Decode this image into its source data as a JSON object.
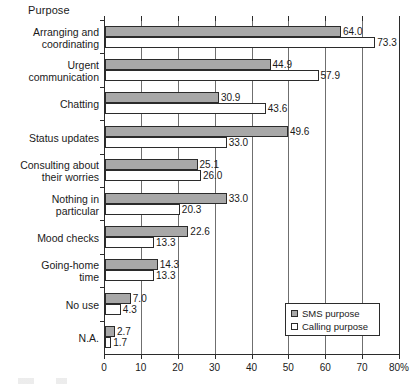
{
  "chart_data": {
    "type": "bar",
    "orientation": "horizontal",
    "title": "Purpose",
    "xlabel": "",
    "ylabel": "",
    "xlim": [
      0,
      80
    ],
    "xticks": [
      0,
      10,
      20,
      30,
      40,
      50,
      60,
      70,
      80
    ],
    "xtick_labels": [
      "0",
      "10",
      "20",
      "30",
      "40",
      "50",
      "60",
      "70",
      "80%"
    ],
    "grid": "vertical",
    "legend_position": "bottom-right",
    "categories": [
      "Arranging and coordinating",
      "Urgent communication",
      "Chatting",
      "Status updates",
      "Consulting about their worries",
      "Nothing in particular",
      "Mood checks",
      "Going-home time",
      "No use",
      "N.A."
    ],
    "category_lines": [
      [
        "Arranging and",
        "coordinating"
      ],
      [
        "Urgent",
        "communication"
      ],
      [
        "Chatting"
      ],
      [
        "Status updates"
      ],
      [
        "Consulting about",
        "their worries"
      ],
      [
        "Nothing in",
        "particular"
      ],
      [
        "Mood checks"
      ],
      [
        "Going-home",
        "time"
      ],
      [
        "No use"
      ],
      [
        "N.A."
      ]
    ],
    "series": [
      {
        "name": "SMS purpose",
        "color": "#a8a8a8",
        "values": [
          64.0,
          44.9,
          30.9,
          49.6,
          25.1,
          33.0,
          22.6,
          14.3,
          7.0,
          2.7
        ],
        "value_labels": [
          "64.0",
          "44.9",
          "30.9",
          "49.6",
          "25.1",
          "33.0",
          "22.6",
          "14.3",
          "7.0",
          "2.7"
        ]
      },
      {
        "name": "Calling purpose",
        "color": "#ffffff",
        "values": [
          73.3,
          57.9,
          43.6,
          33.0,
          26.0,
          20.3,
          13.3,
          13.3,
          4.3,
          1.7
        ],
        "value_labels": [
          "73.3",
          "57.9",
          "43.6",
          "33.0",
          "26.0",
          "20.3",
          "13.3",
          "13.3",
          "4.3",
          "1.7"
        ]
      }
    ]
  },
  "legend": {
    "items": [
      {
        "label": "SMS purpose",
        "swatch": "filled-gray-square-icon"
      },
      {
        "label": "Calling purpose",
        "swatch": "outlined-white-square-icon"
      }
    ]
  }
}
